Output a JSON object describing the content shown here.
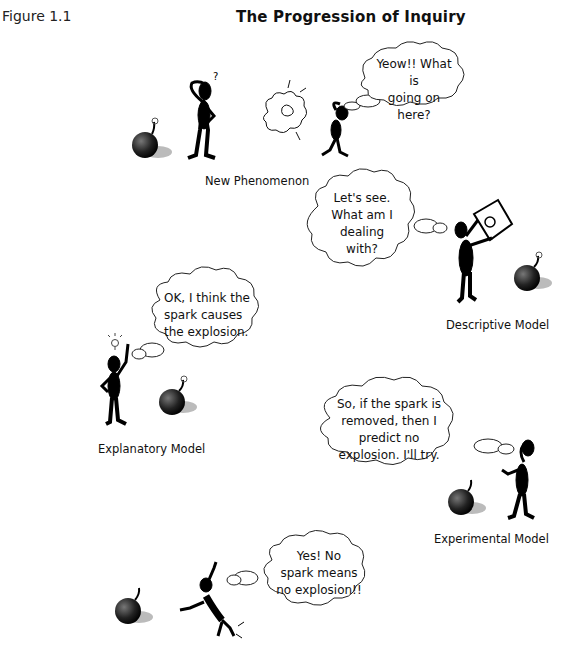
{
  "figure_label": "Figure 1.1",
  "title": "The Progression of Inquiry",
  "stages": [
    {
      "caption": "New Phenomenon",
      "thought": "Yeow!! What is\ngoing on here?"
    },
    {
      "caption": "Descriptive Model",
      "thought": "Let's see.\nWhat am I\ndealing\nwith?"
    },
    {
      "caption": "Explanatory Model",
      "thought": "OK, I think the\nspark causes\nthe explosion."
    },
    {
      "caption": "Experimental Model",
      "thought": "So, if the spark is\nremoved, then I\npredict  no\nexplosion. I'll try."
    },
    {
      "caption": "",
      "thought": "Yes! No\nspark means\nno explosion!!"
    }
  ],
  "icons": {
    "bomb": "bomb-icon",
    "figure": "stick-figure-icon",
    "explosion": "explosion-cloud-icon",
    "lightbulb": "lightbulb-icon",
    "sign": "sign-icon"
  }
}
